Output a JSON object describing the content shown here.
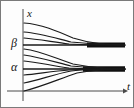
{
  "figure": {
    "name": "solution-curves-phase-diagram",
    "type": "line",
    "background_color": "#fdfdfd",
    "border_color": "#7a7a7a",
    "curve_color": "#1a1a1a",
    "axis_color": "#444444",
    "width": 134,
    "height": 108
  },
  "labels": {
    "x_axis": "x",
    "t_axis": "t",
    "equilibrium_upper": "β",
    "equilibrium_lower": "α"
  },
  "chart_data": {
    "type": "line",
    "title": "",
    "subtitle": "",
    "xlabel": "t",
    "ylabel": "x",
    "grid": false,
    "legend": null,
    "xlim": [
      0,
      112
    ],
    "ylim": [
      0,
      90
    ],
    "axes": {
      "vertical_axis_x": 22,
      "horizontal_axis_y": 90,
      "origin": [
        22,
        90
      ],
      "x_axis_arrow_tip": [
        122,
        90
      ],
      "y_axis_top": [
        22,
        8
      ]
    },
    "equilibria": [
      {
        "name": "β",
        "y_pixel": 44,
        "label_pos": [
          11,
          38
        ],
        "stability": "attracting-from-above",
        "line_start_x": 22,
        "line_end_x": 124,
        "band_thick_from_x": 86
      },
      {
        "name": "α",
        "y_pixel": 68,
        "label_pos": [
          11,
          62
        ],
        "stability": "attracting",
        "line_start_x": 22,
        "line_end_x": 124,
        "band_thick_from_x": 82
      }
    ],
    "series": [
      {
        "name": "above-beta-1",
        "region": "above β",
        "direction": "decreasing-to-β",
        "path": "M 23 22 C 40 23, 56 30, 72 37 C 88 42, 104 44, 124 44"
      },
      {
        "name": "above-beta-2",
        "region": "above β",
        "direction": "decreasing-to-β",
        "path": "M 23 31 C 38 32, 54 37, 70 41 C 88 43, 104 44, 124 44"
      },
      {
        "name": "above-beta-3",
        "region": "above β",
        "direction": "decreasing-to-β",
        "path": "M 23 37 C 36 38, 52 41, 68 43 C 88 44, 104 44, 124 44"
      },
      {
        "name": "between-1",
        "region": "between α and β",
        "direction": "decreasing-to-α",
        "path": "M 23 48 C 40 50, 56 58, 72 63 C 88 66, 104 68, 124 68"
      },
      {
        "name": "between-2",
        "region": "between α and β",
        "direction": "decreasing-to-α",
        "path": "M 23 54 C 38 56, 54 61, 70 65 C 88 67, 104 68, 124 68"
      },
      {
        "name": "between-3",
        "region": "between α and β",
        "direction": "decreasing-to-α",
        "path": "M 23 60 C 36 61, 52 65, 68 67 C 88 68, 104 68, 124 68"
      },
      {
        "name": "below-alpha-1",
        "region": "below α",
        "direction": "increasing-to-α",
        "path": "M 23 74 C 36 73, 52 70, 68 69 C 88 68, 104 68, 124 68"
      },
      {
        "name": "below-alpha-2",
        "region": "below α",
        "direction": "increasing-to-α",
        "path": "M 23 82 C 38 79, 54 73, 70 70 C 88 68, 104 68, 124 68"
      },
      {
        "name": "below-alpha-3",
        "region": "below α",
        "direction": "increasing-to-α",
        "path": "M 23 90 C 40 86, 58 78, 76 72 C 92 69, 106 68, 124 68"
      }
    ]
  }
}
